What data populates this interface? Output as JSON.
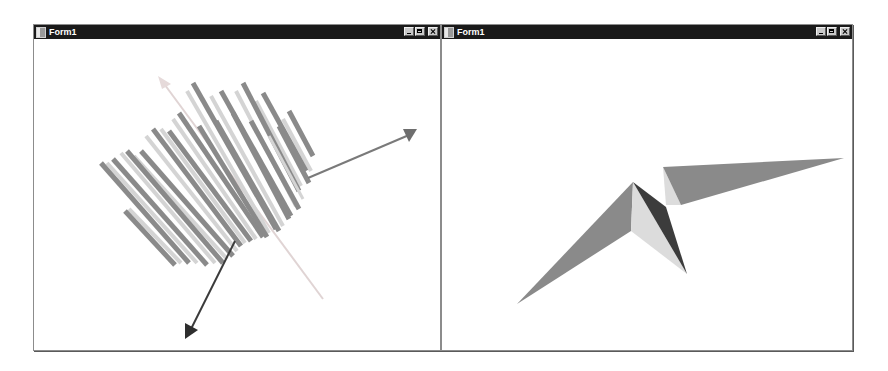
{
  "windows": [
    {
      "title": "Form1",
      "controls": [
        "minimize",
        "maximize",
        "close"
      ],
      "content": {
        "type": "3d-bar-chart",
        "axes": [
          {
            "name": "y-axis",
            "color": "#d8c8c8"
          },
          {
            "name": "x-axis",
            "color": "#7a7a7a"
          },
          {
            "name": "z-axis",
            "color": "#3a3a3a"
          }
        ],
        "bar_colors": {
          "light": "#d4d4d4",
          "dark": "#8a8a8a"
        }
      }
    },
    {
      "title": "Form1",
      "controls": [
        "minimize",
        "maximize",
        "close"
      ],
      "content": {
        "type": "3d-surface",
        "face_colors": {
          "mid": "#8a8a8a",
          "light": "#dcdcdc",
          "dark": "#3c3c3c"
        }
      }
    }
  ]
}
